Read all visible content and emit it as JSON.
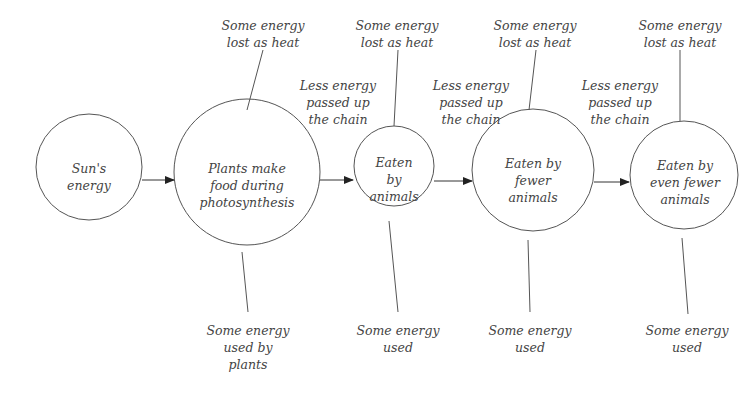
{
  "diagram": {
    "nodes": [
      {
        "id": "sun",
        "label": "Sun's\nenergy"
      },
      {
        "id": "plants",
        "label": "Plants make\nfood during\nphotosynthesis"
      },
      {
        "id": "animals",
        "label": "Eaten\nby\nanimals"
      },
      {
        "id": "fewer",
        "label": "Eaten by\nfewer\nanimals"
      },
      {
        "id": "evenfewer",
        "label": "Eaten by\neven fewer\nanimals"
      }
    ],
    "heat_labels": [
      "Some energy\nlost as heat",
      "Some energy\nlost as heat",
      "Some energy\nlost as heat",
      "Some energy\nlost as heat"
    ],
    "used_labels": [
      "Some energy\nused by\nplants",
      "Some energy\nused",
      "Some energy\nused",
      "Some energy\nused"
    ],
    "passed_labels": [
      "Less energy\npassed up\nthe chain",
      "Less energy\npassed up\nthe chain",
      "Less energy\npassed up\nthe chain"
    ],
    "colors": {
      "line": "#555555",
      "text": "#444444",
      "background": "#ffffff"
    }
  }
}
